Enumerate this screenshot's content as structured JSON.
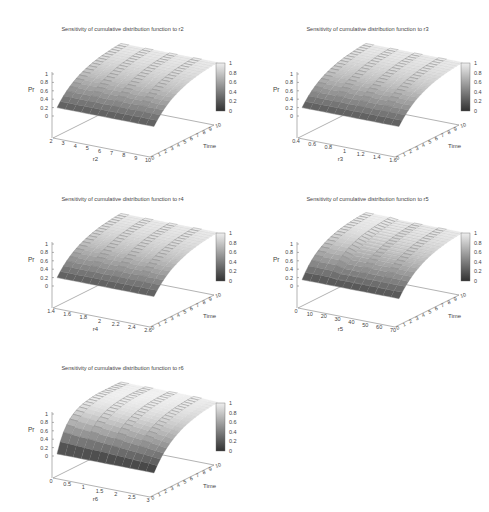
{
  "figure": {
    "panels": [
      {
        "id": "r2",
        "title": "Sensitivity of cumulative distribution function to r2",
        "xlabel": "r2",
        "xticks": [
          "2",
          "3",
          "4",
          "5",
          "6",
          "7",
          "8",
          "9",
          "10"
        ],
        "shape": "flat"
      },
      {
        "id": "r3",
        "title": "Sensitivity of cumulative distribution function to r3",
        "xlabel": "r3",
        "xticks": [
          "0.4",
          "0.6",
          "0.8",
          "1",
          "1.2",
          "1.4",
          "1.6"
        ],
        "shape": "flat"
      },
      {
        "id": "r4",
        "title": "Sensitivity of cumulative distribution function to r4",
        "xlabel": "r4",
        "xticks": [
          "1.4",
          "1.6",
          "1.8",
          "2",
          "2.2",
          "2.4",
          "2.6"
        ],
        "shape": "flat"
      },
      {
        "id": "r5",
        "title": "Sensitivity of cumulative distribution function to r5",
        "xlabel": "r5",
        "xticks": [
          "0",
          "10",
          "20",
          "30",
          "40",
          "50",
          "60",
          "70"
        ],
        "shape": "kink"
      },
      {
        "id": "r6",
        "title": "Sensitivity of cumulative distribution function to r6",
        "xlabel": "r6",
        "xticks": [
          "0",
          "0.5",
          "1",
          "1.5",
          "2",
          "2.5",
          "3"
        ],
        "shape": "steep"
      }
    ],
    "shared": {
      "zlabel": "Pr",
      "zticks": [
        "0",
        "0.2",
        "0.4",
        "0.6",
        "0.8",
        "1"
      ],
      "ylabel": "Time",
      "yticks": [
        "0",
        "1",
        "2",
        "3",
        "4",
        "5",
        "6",
        "7",
        "8",
        "9",
        "10"
      ],
      "colorbar_ticks": [
        "0",
        "0.2",
        "0.4",
        "0.6",
        "0.8",
        "1"
      ]
    }
  },
  "chart_data": [
    {
      "type": "surface",
      "title": "Sensitivity of cumulative distribution function to r2",
      "xlabel": "r2",
      "ylabel": "Time",
      "zlabel": "Pr",
      "xlim": [
        2,
        10
      ],
      "ylim": [
        0,
        10
      ],
      "zlim": [
        0,
        1
      ],
      "colorbar": [
        0,
        1
      ],
      "colormap": "gray",
      "description": "Pr rises with Time from ~0.2 at Time=0 to ~1 at Time=10; nearly constant across r2",
      "x": [
        2,
        4,
        6,
        8,
        10
      ],
      "time": [
        0,
        2,
        4,
        6,
        8,
        10
      ],
      "z_at_each_x": [
        0.2,
        0.45,
        0.65,
        0.8,
        0.9,
        0.95
      ]
    },
    {
      "type": "surface",
      "title": "Sensitivity of cumulative distribution function to r3",
      "xlabel": "r3",
      "ylabel": "Time",
      "zlabel": "Pr",
      "xlim": [
        0.4,
        1.6
      ],
      "ylim": [
        0,
        10
      ],
      "zlim": [
        0,
        1
      ],
      "colorbar": [
        0,
        1
      ],
      "colormap": "gray",
      "description": "Pr rises with Time from ~0.2 to ~1; nearly constant across r3",
      "x": [
        0.4,
        0.7,
        1.0,
        1.3,
        1.6
      ],
      "time": [
        0,
        2,
        4,
        6,
        8,
        10
      ],
      "z_at_each_x": [
        0.2,
        0.45,
        0.65,
        0.8,
        0.9,
        0.95
      ]
    },
    {
      "type": "surface",
      "title": "Sensitivity of cumulative distribution function to r4",
      "xlabel": "r4",
      "ylabel": "Time",
      "zlabel": "Pr",
      "xlim": [
        1.4,
        2.6
      ],
      "ylim": [
        0,
        10
      ],
      "zlim": [
        0,
        1
      ],
      "colorbar": [
        0,
        1
      ],
      "colormap": "gray",
      "description": "Pr rises with Time from ~0.2 to ~1; nearly constant across r4",
      "x": [
        1.4,
        1.7,
        2.0,
        2.3,
        2.6
      ],
      "time": [
        0,
        2,
        4,
        6,
        8,
        10
      ],
      "z_at_each_x": [
        0.2,
        0.45,
        0.65,
        0.8,
        0.9,
        0.95
      ]
    },
    {
      "type": "surface",
      "title": "Sensitivity of cumulative distribution function to r5",
      "xlabel": "r5",
      "ylabel": "Time",
      "zlabel": "Pr",
      "xlim": [
        0,
        70
      ],
      "ylim": [
        0,
        10
      ],
      "zlim": [
        0,
        1
      ],
      "colorbar": [
        0,
        1
      ],
      "colormap": "gray",
      "description": "Pr rises with Time from ~0.15 to ~1; slightly steeper for small r5 (0-20), then flat",
      "x": [
        0,
        10,
        20,
        40,
        70
      ],
      "time": [
        0,
        2,
        4,
        6,
        8,
        10
      ],
      "z_at_each_x": [
        0.15,
        0.45,
        0.65,
        0.8,
        0.9,
        0.95
      ]
    },
    {
      "type": "surface",
      "title": "Sensitivity of cumulative distribution function to r6",
      "xlabel": "r6",
      "ylabel": "Time",
      "zlabel": "Pr",
      "xlim": [
        0,
        3
      ],
      "ylim": [
        0,
        10
      ],
      "zlim": [
        0,
        1
      ],
      "colorbar": [
        0,
        1
      ],
      "colormap": "gray",
      "description": "Pr rises with Time from ~0.05 to ~1; rises fastest at small r6 (near 0)",
      "x": [
        0,
        0.5,
        1,
        2,
        3
      ],
      "time": [
        0,
        2,
        4,
        6,
        8,
        10
      ],
      "z_at_each_x": [
        0.05,
        0.4,
        0.62,
        0.78,
        0.9,
        0.96
      ]
    }
  ]
}
